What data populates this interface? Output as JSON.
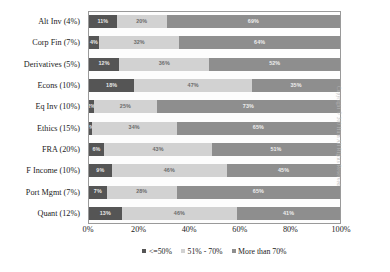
{
  "chart_data": {
    "type": "bar",
    "subtype": "horizontal-100-percent-stacked",
    "title": "",
    "xlabel": "",
    "ylabel": "",
    "xlim": [
      0,
      100
    ],
    "grid": false,
    "legend_position": "bottom-center",
    "categories": [
      "Alt Inv (4%)",
      "Corp Fin (7%)",
      "Derivatives (5%)",
      "Econs (10%)",
      "Eq Inv (10%)",
      "Ethics (15%)",
      "FRA (20%)",
      "F Income (10%)",
      "Port Mgmt (7%)",
      "Quant (12%)"
    ],
    "series": [
      {
        "name": "<=50%",
        "color": "#555555",
        "values": [
          11,
          4,
          12,
          18,
          2,
          1,
          6,
          9,
          7,
          13
        ],
        "labels": [
          "11%",
          "4%",
          "12%",
          "18%",
          "2%",
          "1%",
          "6%",
          "9%",
          "7%",
          "13%"
        ]
      },
      {
        "name": "51% - 70%",
        "color": "#d2d2d2",
        "values": [
          20,
          32,
          36,
          47,
          25,
          34,
          43,
          46,
          28,
          46
        ],
        "labels": [
          "20%",
          "32%",
          "36%",
          "47%",
          "25%",
          "34%",
          "43%",
          "46%",
          "28%",
          "46%"
        ]
      },
      {
        "name": "More than 70%",
        "color": "#8e8e8e",
        "values": [
          69,
          64,
          52,
          35,
          73,
          65,
          51,
          45,
          65,
          41
        ],
        "labels": [
          "69%",
          "64%",
          "52%",
          "35%",
          "73%",
          "65%",
          "51%",
          "45%",
          "65%",
          "41%"
        ]
      }
    ],
    "xticks": [
      "0%",
      "20%",
      "40%",
      "60%",
      "80%",
      "100%"
    ],
    "xtick_values": [
      0,
      20,
      40,
      60,
      80,
      100
    ]
  },
  "legend": {
    "items": [
      {
        "label": "<=50%",
        "color": "#555555"
      },
      {
        "label": "51% - 70%",
        "color": "#d2d2d2"
      },
      {
        "label": "More than 70%",
        "color": "#8e8e8e"
      }
    ]
  },
  "watermark": {
    "text": "Copyright © 300 Hum All Rights Reserved"
  }
}
